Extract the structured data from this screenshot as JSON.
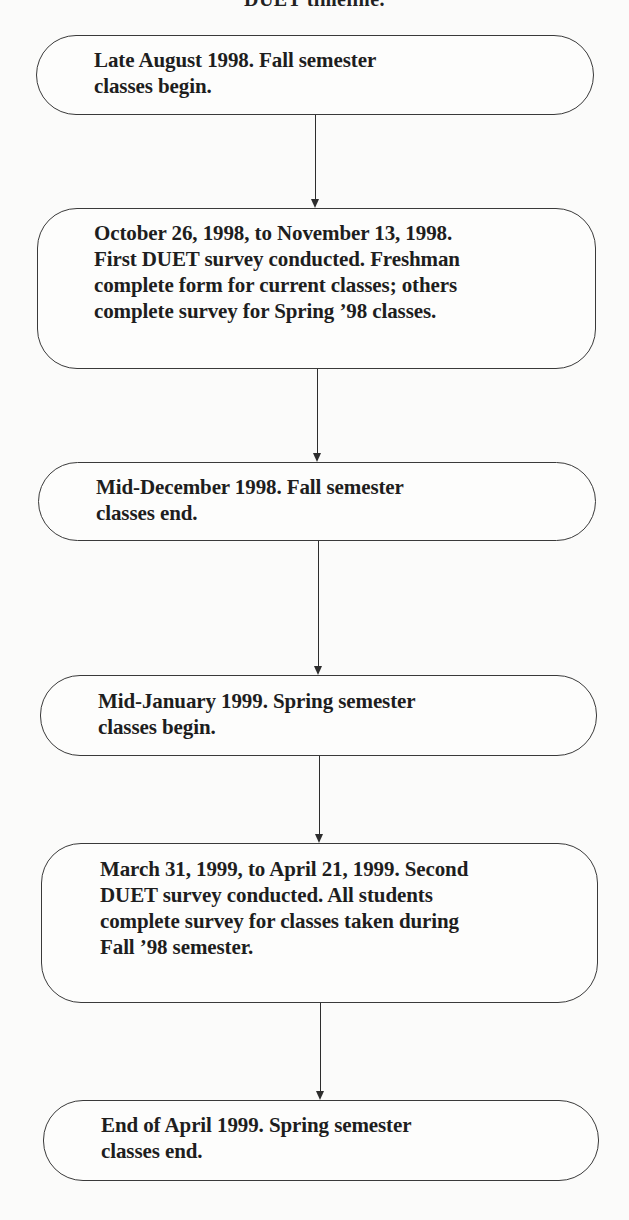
{
  "title": "DUET timeline.",
  "flowchart": {
    "nodes": [
      {
        "id": "n1",
        "lines": [
          "Late August 1998. Fall semester",
          "classes begin."
        ]
      },
      {
        "id": "n2",
        "lines": [
          "October 26, 1998, to November 13, 1998.",
          "First DUET survey conducted. Freshman",
          "complete form for current classes; others",
          "complete survey for Spring ’98 classes."
        ]
      },
      {
        "id": "n3",
        "lines": [
          "Mid-December 1998. Fall semester",
          "classes end."
        ]
      },
      {
        "id": "n4",
        "lines": [
          "Mid-January 1999. Spring semester",
          "classes begin."
        ]
      },
      {
        "id": "n5",
        "lines": [
          "March 31, 1999, to April 21, 1999. Second",
          "DUET survey conducted. All students",
          "complete survey for classes taken during",
          "Fall ’98 semester."
        ]
      },
      {
        "id": "n6",
        "lines": [
          "End of April 1999. Spring semester",
          "classes end."
        ]
      }
    ],
    "edges": [
      {
        "from": "n1",
        "to": "n2"
      },
      {
        "from": "n2",
        "to": "n3"
      },
      {
        "from": "n3",
        "to": "n4"
      },
      {
        "from": "n4",
        "to": "n5"
      },
      {
        "from": "n5",
        "to": "n6"
      }
    ],
    "colors": {
      "stroke": "#3a3a3a",
      "text": "#1e1e1e",
      "background": "#fbfbfa"
    }
  }
}
